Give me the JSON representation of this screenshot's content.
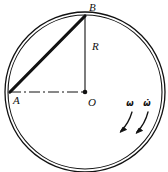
{
  "figure": {
    "type": "mechanics-diagram",
    "background_color": "#ffffff",
    "stroke_color": "#111111"
  },
  "geometry": {
    "circle": {
      "label": "rim",
      "center_x": 85,
      "center_y": 92,
      "outer_radius": 80,
      "inner_radius": 77,
      "double_line": true
    },
    "points": [
      {
        "id": "A",
        "label": "A",
        "x": 10,
        "y": 92,
        "label_x": 13,
        "label_y": 104,
        "dot": false
      },
      {
        "id": "B",
        "label": "B",
        "x": 85,
        "y": 16,
        "label_x": 89,
        "label_y": 11,
        "dot": false
      },
      {
        "id": "O",
        "label": "O",
        "x": 85,
        "y": 92,
        "label_x": 88,
        "label_y": 106,
        "dot": true
      }
    ],
    "segments": [
      {
        "id": "chord-AB",
        "from": "A",
        "to": "B",
        "style": "solid",
        "width": 3.2
      },
      {
        "id": "radius-OB",
        "from": "B",
        "to": "O",
        "style": "solid",
        "width": 1.1,
        "label": "R",
        "label_x": 92,
        "label_y": 50
      },
      {
        "id": "centerline-AO",
        "from": "A",
        "to": "O",
        "style": "dash-dot",
        "width": 1.0
      }
    ]
  },
  "annotations": {
    "angular_velocity": {
      "symbol": "ω",
      "name": "omega",
      "meaning": "angular velocity",
      "label_x": 130,
      "label_y": 106,
      "arrow": {
        "start_x": 130,
        "start_y": 112,
        "end_x": 120,
        "end_y": 131
      }
    },
    "angular_acceleration": {
      "symbol": "ω̇",
      "name": "omega-dot",
      "meaning": "angular acceleration",
      "label_x": 147,
      "label_y": 106,
      "arrow": {
        "start_x": 147,
        "start_y": 112,
        "end_x": 136,
        "end_y": 132
      }
    }
  }
}
